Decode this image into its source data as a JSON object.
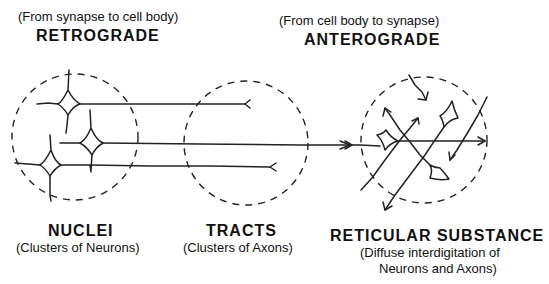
{
  "top_labels": {
    "retrograde": {
      "subtitle": "(From synapse to cell body)",
      "title": "RETROGRADE"
    },
    "anterograde": {
      "subtitle": "(From cell body to synapse)",
      "title": "ANTEROGRADE"
    }
  },
  "regions": [
    {
      "title": "NUCLEI",
      "description": "(Clusters of Neurons)"
    },
    {
      "title": "TRACTS",
      "description": "(Clusters of Axons)"
    },
    {
      "title": "RETICULAR SUBSTANCE",
      "description_line1": "(Diffuse interdigitation of",
      "description_line2": "Neurons and Axons)"
    }
  ],
  "colors": {
    "ink": "#222222",
    "background": "#ffffff"
  }
}
